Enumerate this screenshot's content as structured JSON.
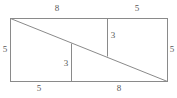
{
  "figure": {
    "type": "geometry-diagram",
    "stroke_color": "#8a8a8a",
    "label_color": "#585858",
    "background_color": "#ffffff",
    "canvas": {
      "width": 177,
      "height": 98
    },
    "rectangle": {
      "left": 10,
      "top": 18,
      "right": 168,
      "bottom": 82,
      "width": 158,
      "height": 64
    },
    "diagonal": {
      "from": {
        "x": 10,
        "y": 18
      },
      "to": {
        "x": 168,
        "y": 82
      }
    },
    "segments": [
      {
        "name": "upper-vertical-segment",
        "from": {
          "x": 107,
          "y": 18
        },
        "to": {
          "x": 107,
          "y": 57
        }
      },
      {
        "name": "lower-vertical-segment",
        "from": {
          "x": 71,
          "y": 43
        },
        "to": {
          "x": 71,
          "y": 82
        }
      }
    ],
    "labels": [
      {
        "name": "top-left-length-label",
        "text": "8",
        "x": 57,
        "y": 8
      },
      {
        "name": "top-right-length-label",
        "text": "5",
        "x": 137,
        "y": 8
      },
      {
        "name": "left-height-label",
        "text": "5",
        "x": 5,
        "y": 46
      },
      {
        "name": "right-height-label",
        "text": "5",
        "x": 172,
        "y": 46
      },
      {
        "name": "upper-segment-length-label",
        "text": "3",
        "x": 113,
        "y": 33
      },
      {
        "name": "lower-segment-length-label",
        "text": "3",
        "x": 66,
        "y": 60
      },
      {
        "name": "bottom-left-length-label",
        "text": "5",
        "x": 39,
        "y": 85
      },
      {
        "name": "bottom-right-length-label",
        "text": "8",
        "x": 119,
        "y": 85
      }
    ]
  }
}
